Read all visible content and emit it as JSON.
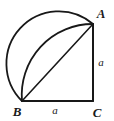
{
  "figure": {
    "background_color": "#ffffff",
    "stroke_color": "#181818",
    "label_color": "#1a1a1a",
    "vertices": [
      {
        "name": "A",
        "label": "A",
        "x": 93,
        "y": 24,
        "label_x": 101,
        "label_y": 18
      },
      {
        "name": "B",
        "label": "B",
        "x": 22,
        "y": 101,
        "label_x": 17,
        "label_y": 116
      },
      {
        "name": "C",
        "label": "C",
        "x": 93,
        "y": 101,
        "label_x": 97,
        "label_y": 117
      }
    ],
    "side_labels": [
      {
        "name": "vertical-leg",
        "label": "a",
        "x": 101,
        "y": 66
      },
      {
        "name": "horizontal-leg",
        "label": "a",
        "x": 55,
        "y": 114
      }
    ],
    "segments": [
      {
        "name": "segment-AC",
        "from": "A",
        "to": "C",
        "width": 2
      },
      {
        "name": "segment-BC",
        "from": "B",
        "to": "C",
        "width": 2
      },
      {
        "name": "segment-BA",
        "from": "B",
        "to": "A",
        "width": 1.6
      }
    ],
    "arcs": [
      {
        "name": "semicircle-on-AB",
        "description": "Semicircle with diameter AB bulging up and left",
        "path": "M 22 101 A 52.4 52.4 0 0 1 93 24",
        "width": 1.8
      },
      {
        "name": "quarter-arc-centered-C",
        "description": "Quarter circle arc from B to A centered at C with radius a",
        "path": "M 22 101 A 71 71 0 0 1 93 24",
        "width": 1.8
      }
    ]
  }
}
